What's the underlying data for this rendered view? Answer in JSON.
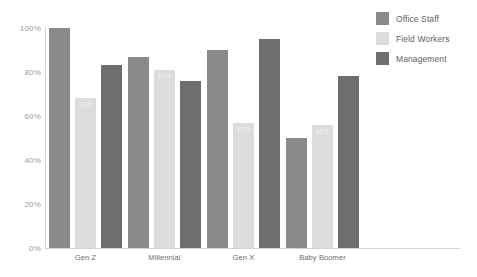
{
  "chart_data": {
    "type": "bar",
    "title": "",
    "subtitle": "",
    "xlabel": "",
    "ylabel": "",
    "ylim": [
      0,
      100
    ],
    "yticks": [
      "0%",
      "20%",
      "40%",
      "60%",
      "80%",
      "100%"
    ],
    "ytick_values": [
      0,
      20,
      40,
      60,
      80,
      100
    ],
    "grid": false,
    "legend_position": "top-right",
    "value_suffix": "%",
    "categories": [
      "Gen Z",
      "Millennial",
      "Gen X",
      "Baby Boomer"
    ],
    "series": [
      {
        "name": "Office Staff",
        "color": "#8a8a8a",
        "values": [
          100,
          87,
          90,
          50
        ],
        "labels": [
          "",
          "",
          "",
          ""
        ]
      },
      {
        "name": "Field Workers",
        "color": "#dcdcdc",
        "values": [
          68,
          81,
          57,
          56
        ],
        "labels": [
          "68%",
          "81%",
          "57%",
          "56%"
        ]
      },
      {
        "name": "Management",
        "color": "#6e6e6e",
        "values": [
          83,
          76,
          95,
          78
        ],
        "labels": [
          "",
          "",
          "",
          ""
        ]
      }
    ]
  },
  "axis": {
    "line_color": "#d2d2d2",
    "tick_text_color": "#9a9a9a",
    "category_text_color": "#6e6e6e"
  },
  "legend": {
    "items": [
      {
        "label": "Office Staff",
        "color": "#8a8a8a"
      },
      {
        "label": "Field Workers",
        "color": "#dcdcdc"
      },
      {
        "label": "Management",
        "color": "#6e6e6e"
      }
    ]
  }
}
